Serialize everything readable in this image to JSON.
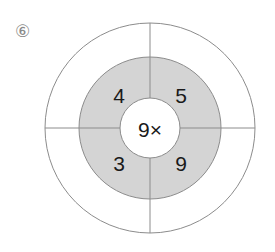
{
  "page": {
    "background_color": "#ffffff",
    "item_marker": "⑥"
  },
  "diagram": {
    "type": "concentric-target-wheel",
    "center_label": "9×",
    "colors": {
      "outer_ring_fill": "#ffffff",
      "middle_ring_fill": "#d4d4d4",
      "inner_circle_fill": "#ffffff",
      "stroke": "#8c8c8c",
      "text": "#1a1a1a"
    },
    "geometry": {
      "center_x": 150,
      "center_y": 128,
      "outer_radius": 105,
      "middle_radius": 71,
      "inner_radius": 30
    },
    "quadrants": [
      {
        "position": "top-left",
        "value": "4"
      },
      {
        "position": "top-right",
        "value": "5"
      },
      {
        "position": "bottom-left",
        "value": "3"
      },
      {
        "position": "bottom-right",
        "value": "9"
      }
    ]
  }
}
